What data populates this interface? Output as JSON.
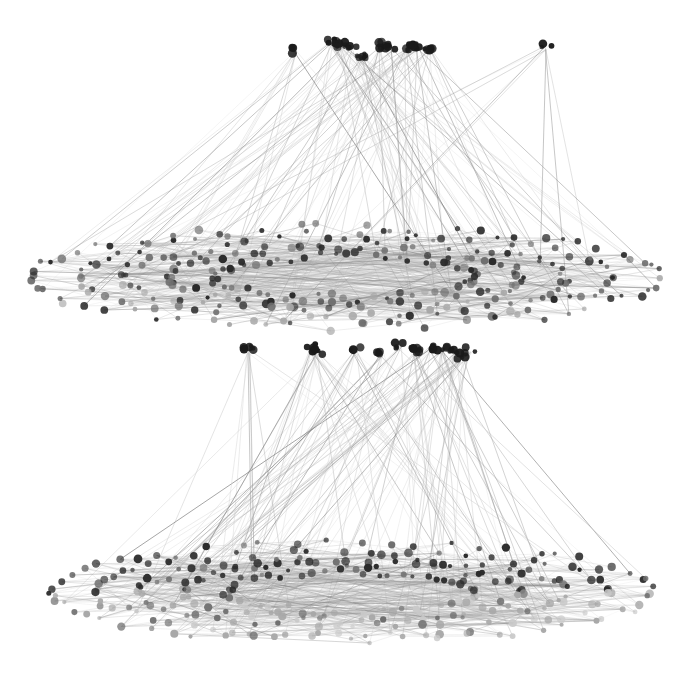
{
  "figure": {
    "title": "Two-layer hierarchical network graph",
    "type": "node-link-3d",
    "width": 677,
    "height": 679,
    "background_color": "#ffffff",
    "rendering": "grayscale"
  },
  "palette": {
    "background": "#ffffff",
    "node_dark": "#2b2b2b",
    "node_mid": "#6e6e6e",
    "node_light": "#a8a8a8",
    "node_faint": "#c9c9c9",
    "hub_node": "#1a1a1a",
    "edge_dark": "#7a7a7a",
    "edge_mid": "#a6a6a6",
    "edge_light": "#cfcfcf",
    "edge_faint": "#e0e0e0"
  },
  "layers": [
    {
      "id": "upper-layer",
      "name": "Upper layer",
      "disk": {
        "center_x": 345,
        "center_y": 277,
        "radius_x": 312,
        "radius_y": 50,
        "ring_count": 5,
        "node_count": 300
      },
      "hubs": {
        "baseline_y": 47,
        "count": 11,
        "positions_x": [
          295,
          331,
          341,
          351,
          362,
          380,
          392,
          406,
          418,
          430,
          546
        ],
        "positions_y": [
          50,
          42,
          45,
          49,
          56,
          45,
          47,
          48,
          46,
          48,
          46
        ]
      },
      "edge_count": 120
    },
    {
      "id": "lower-layer",
      "name": "Lower layer",
      "disk": {
        "center_x": 352,
        "center_y": 592,
        "radius_x": 300,
        "radius_y": 48,
        "ring_count": 5,
        "node_count": 300
      },
      "hubs": {
        "baseline_y": 350,
        "count": 12,
        "positions_x": [
          248,
          310,
          318,
          355,
          382,
          400,
          415,
          430,
          442,
          455,
          462,
          470
        ],
        "positions_y": [
          349,
          347,
          352,
          350,
          353,
          345,
          350,
          347,
          349,
          352,
          358,
          350
        ]
      },
      "edge_count": 130
    }
  ],
  "legend": {
    "visible": false
  },
  "axes": {
    "visible": false
  }
}
